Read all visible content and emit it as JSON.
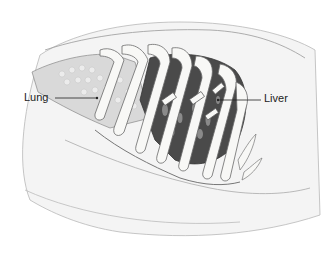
{
  "diagram": {
    "type": "anatomical-illustration",
    "labels": [
      {
        "text": "Lung",
        "x": 24,
        "y": 92,
        "pointer_to": [
          97,
          98
        ]
      },
      {
        "text": "Liver",
        "x": 264,
        "y": 93,
        "pointer_to": [
          218,
          100
        ]
      }
    ],
    "colors": {
      "background": "#ffffff",
      "outline": "#555555",
      "skin": "#f2f2f2",
      "rib": "#f7f7f5",
      "cavity_dark": "#3a3a3a",
      "lung_tissue": "#d8d8d8",
      "label_text": "#222222"
    }
  }
}
